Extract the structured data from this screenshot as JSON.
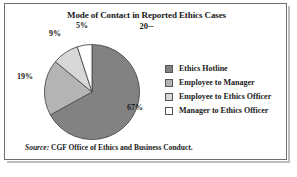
{
  "figure": {
    "border_color": "#6e6e6e",
    "background": "#ffffff"
  },
  "source": {
    "prefix": "Source:",
    "text": " CGF Office of Ethics and Business Conduct."
  },
  "chart_data": {
    "type": "pie",
    "title": "Mode of Contact in Reported Ethics Cases",
    "subtitle": "20--",
    "xlabel": "",
    "ylabel": "",
    "legend_position": "right",
    "grid": false,
    "start_angle": 0,
    "direction": "clockwise",
    "categories": [
      "Ethics Hotline",
      "Employee to Manager",
      "Employee to Ethics Officer",
      "Manager to Ethics Officer"
    ],
    "values": [
      67,
      19,
      9,
      5
    ],
    "data_labels": [
      "67%",
      "19%",
      "9%",
      "5%"
    ],
    "colors": [
      "#828282",
      "#b4b4b4",
      "#d8d8d8",
      "#ffffff"
    ],
    "slice_edge_color": "#4a4a4a",
    "units": "percent"
  }
}
